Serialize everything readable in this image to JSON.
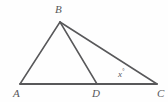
{
  "figure": {
    "type": "geometry-diagram",
    "background_color": "#fefefe",
    "stroke_color": "#58585a",
    "stroke_width": 1.6,
    "label_color": "#58585a",
    "points": {
      "A": {
        "label": "A",
        "x": 20,
        "y": 84,
        "label_x": 13,
        "label_y": 88
      },
      "B": {
        "label": "B",
        "x": 60,
        "y": 22,
        "label_x": 55,
        "label_y": 4
      },
      "C": {
        "label": "C",
        "x": 157,
        "y": 84,
        "label_x": 157,
        "label_y": 88
      },
      "D": {
        "label": "D",
        "x": 97,
        "y": 84,
        "label_x": 92,
        "label_y": 88
      }
    },
    "segments": [
      {
        "name": "AC",
        "from": "A",
        "to": "C"
      },
      {
        "name": "AB",
        "from": "A",
        "to": "B"
      },
      {
        "name": "BD",
        "from": "B",
        "to": "D"
      },
      {
        "name": "BC",
        "from": "B",
        "to": "C"
      }
    ],
    "angles": [
      {
        "name": "angle-at-C",
        "vertex": "C",
        "value_text": "x",
        "degree_symbol": "°",
        "label_x": 118,
        "label_y": 68
      }
    ]
  }
}
